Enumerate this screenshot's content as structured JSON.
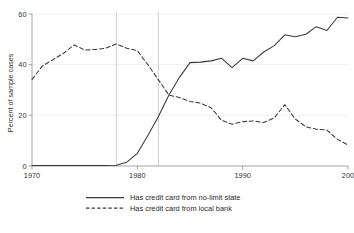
{
  "chart_data": {
    "type": "line",
    "title": "",
    "subtitle": "",
    "xlabel": "",
    "ylabel": "Percent of sample cases",
    "xlim": [
      1970,
      2000
    ],
    "ylim": [
      0,
      60
    ],
    "grid": false,
    "legend_position": "bottom",
    "x_ticks": [
      1970,
      1980,
      1990,
      2000
    ],
    "x_tick_labels": [
      "1970",
      "1980",
      "1990",
      "200"
    ],
    "y_ticks": [
      0,
      20,
      40,
      60
    ],
    "y_tick_labels": [
      "0",
      "20",
      "40",
      "60"
    ],
    "reference_lines": [
      {
        "x": 1978,
        "label": "",
        "color": "#c9c9c9"
      },
      {
        "x": 1982,
        "label": "",
        "color": "#c9c9c9"
      }
    ],
    "x": [
      1970,
      1971,
      1972,
      1973,
      1974,
      1975,
      1976,
      1977,
      1978,
      1979,
      1980,
      1981,
      1982,
      1983,
      1984,
      1985,
      1986,
      1987,
      1988,
      1989,
      1990,
      1991,
      1992,
      1993,
      1994,
      1995,
      1996,
      1997,
      1998,
      1999,
      2000
    ],
    "series": [
      {
        "name": "Has credit card from no-limit state",
        "style": "solid",
        "color": "#3a3a3a",
        "values": [
          0.2,
          0.2,
          0.2,
          0.2,
          0.2,
          0.2,
          0.2,
          0.2,
          0.3,
          1.5,
          5.0,
          12.0,
          19.5,
          28.0,
          35.0,
          40.8,
          41.0,
          41.5,
          42.5,
          38.8,
          42.5,
          41.5,
          45.0,
          47.5,
          51.8,
          51.0,
          52.0,
          55.0,
          53.5,
          58.7,
          58.4
        ]
      },
      {
        "name": "Has credit card from local bank",
        "style": "dashed",
        "color": "#3a3a3a",
        "values": [
          34.2,
          39.5,
          42.0,
          44.5,
          47.8,
          45.8,
          46.0,
          46.5,
          48.2,
          46.5,
          45.5,
          40.0,
          34.0,
          28.0,
          27.0,
          25.5,
          24.8,
          23.0,
          18.0,
          16.5,
          17.5,
          17.8,
          17.2,
          19.0,
          24.2,
          18.5,
          15.5,
          14.5,
          14.2,
          10.5,
          8.3
        ]
      }
    ],
    "legend": [
      {
        "label": "Has credit card from no-limit state",
        "style": "solid"
      },
      {
        "label": "Has credit card from local bank",
        "style": "dashed"
      }
    ]
  }
}
